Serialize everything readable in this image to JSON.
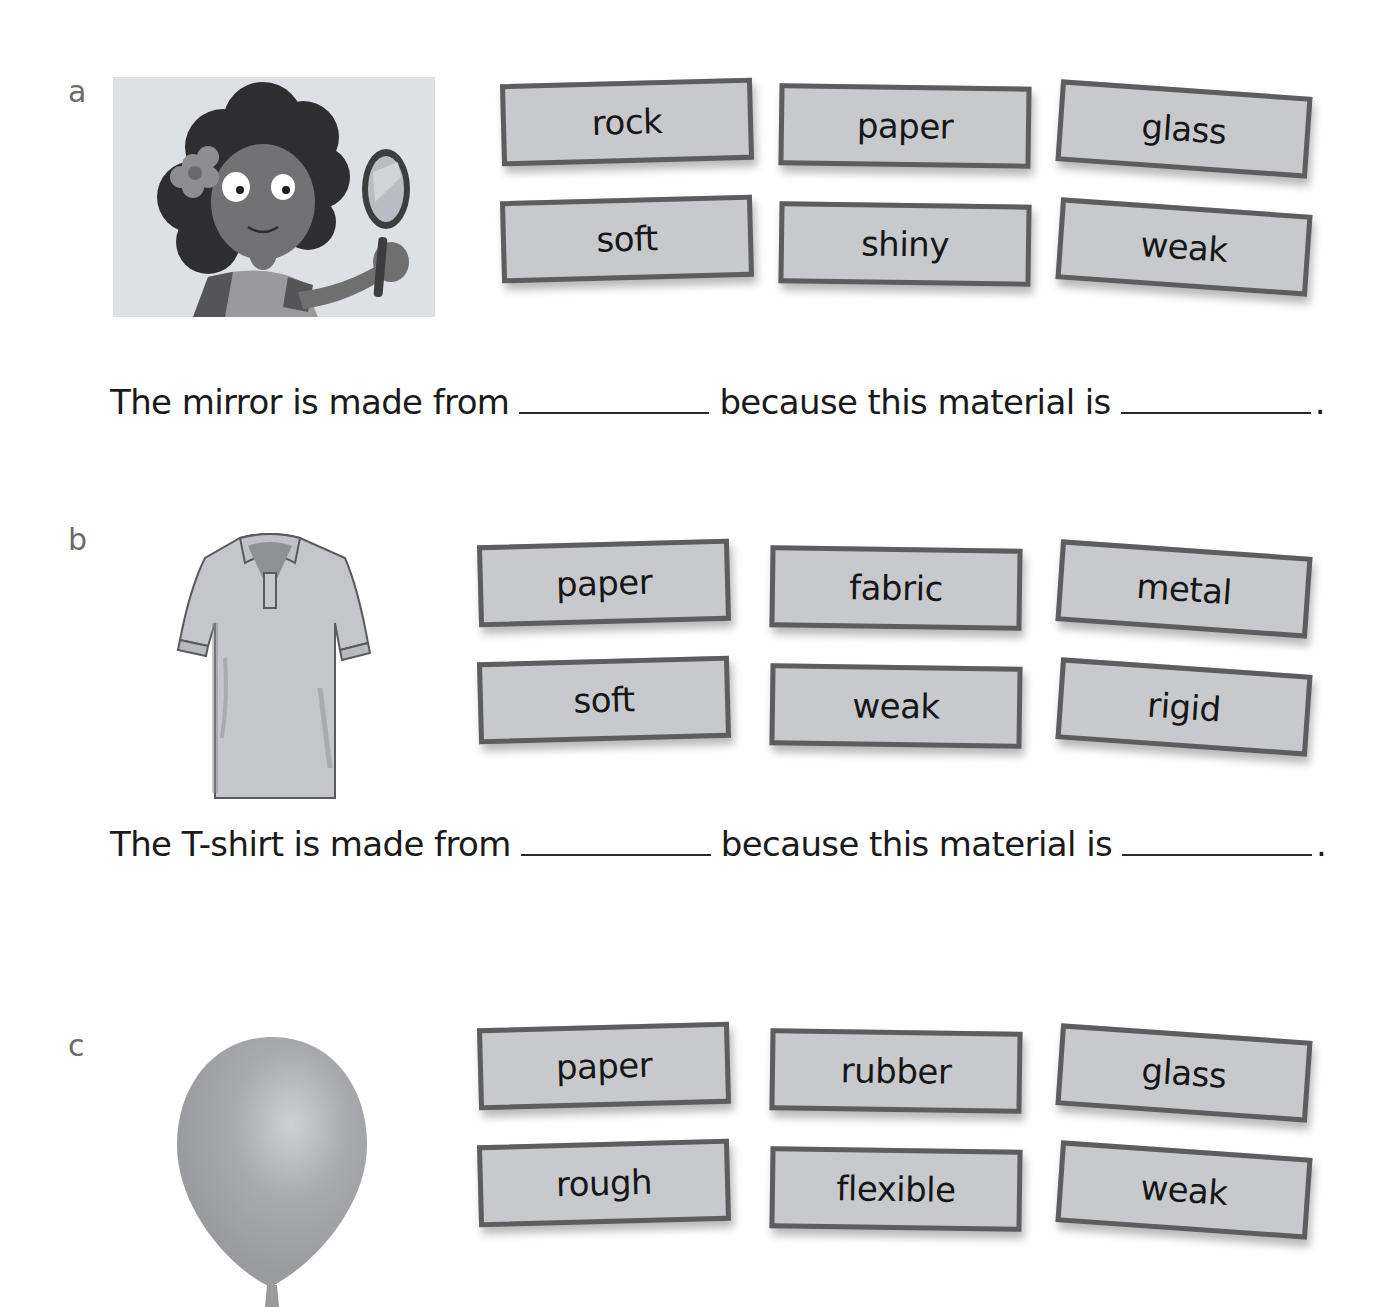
{
  "questions": [
    {
      "letter": "a",
      "image": "girl-holding-mirror",
      "cards": [
        "rock",
        "paper",
        "glass",
        "soft",
        "shiny",
        "weak"
      ],
      "sentence": {
        "part1": "The mirror is made from",
        "part2": "because this material is",
        "end": "."
      }
    },
    {
      "letter": "b",
      "image": "t-shirt",
      "cards": [
        "paper",
        "fabric",
        "metal",
        "soft",
        "weak",
        "rigid"
      ],
      "sentence": {
        "part1": "The T-shirt is made from",
        "part2": "because this material is",
        "end": "."
      }
    },
    {
      "letter": "c",
      "image": "balloon",
      "cards": [
        "paper",
        "rubber",
        "glass",
        "rough",
        "flexible",
        "weak"
      ]
    }
  ],
  "colors": {
    "card_fill": "#c8c9cd",
    "card_border": "#5d5d5f",
    "letter": "#6b6b6b",
    "text": "#1a1a1a"
  }
}
